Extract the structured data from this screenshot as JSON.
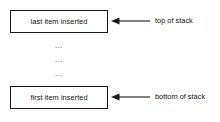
{
  "diagram": {
    "colors": {
      "box_border": "#1a1a1a",
      "text": "#111111",
      "arrow": "#1a1a1a",
      "background": "#ffffff",
      "ellipsis": "#3a3a3a"
    },
    "boxes": [
      {
        "id": "top",
        "label": "last item inserted"
      },
      {
        "id": "bottom",
        "label": "first item inserted"
      }
    ],
    "ellipsis": {
      "rows": [
        "...",
        "...",
        "..."
      ]
    },
    "annotations": [
      {
        "id": "top",
        "label": "top of stack",
        "arrow_direction": "left"
      },
      {
        "id": "bottom",
        "label": "bottom of stack",
        "arrow_direction": "left"
      }
    ]
  }
}
